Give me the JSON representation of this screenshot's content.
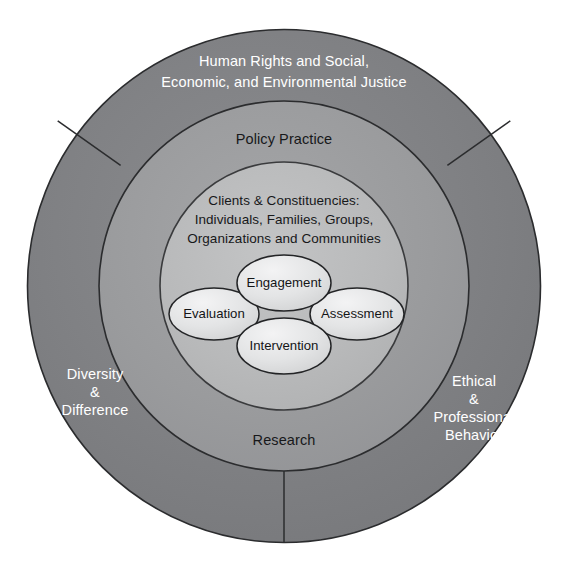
{
  "diagram": {
    "background_color": "#ffffff",
    "center": {
      "x": 284,
      "y": 286
    },
    "rings": {
      "outer": {
        "name": "outer-ring",
        "radius": 257,
        "fill": "#7f8083",
        "stroke": "#2b2c2e",
        "text_color": "#ffffff",
        "labels": {
          "top": [
            "Human Rights and Social,",
            "Economic, and Environmental Justice"
          ],
          "left": [
            "Diversity",
            "&",
            "Difference"
          ],
          "right": [
            "Ethical",
            "&",
            "Professional",
            "Behavior"
          ]
        }
      },
      "middle": {
        "name": "middle-ring",
        "radius": 185,
        "fill": "#9b9c9e",
        "stroke": "#2b2c2e",
        "text_color": "#17181a",
        "labels": {
          "top": "Policy Practice",
          "bottom": "Research"
        }
      },
      "inner": {
        "name": "inner-circle",
        "radius": 124,
        "fill": "#b9babb",
        "stroke": "#3a3b3d",
        "text_color": "#17181a",
        "labels": [
          "Clients & Constituencies:",
          "Individuals, Families, Groups,",
          "Organizations and Communities"
        ]
      }
    },
    "ellipses": [
      {
        "id": "engagement",
        "label": "Engagement",
        "cx": 284,
        "cy": 283,
        "rx": 47,
        "ry": 28,
        "fill": "#e4e5e6",
        "stroke": "#232426"
      },
      {
        "id": "evaluation",
        "label": "Evaluation",
        "cx": 214,
        "cy": 314,
        "rx": 45,
        "ry": 26,
        "fill": "#e4e5e6",
        "stroke": "#232426"
      },
      {
        "id": "assessment",
        "label": "Assessment",
        "cx": 357,
        "cy": 314,
        "rx": 47,
        "ry": 26,
        "fill": "#e4e5e6",
        "stroke": "#232426"
      },
      {
        "id": "intervention",
        "label": "Intervention",
        "cx": 284,
        "cy": 346,
        "rx": 47,
        "ry": 28,
        "fill": "#e4e5e6",
        "stroke": "#232426"
      }
    ],
    "dividers": [
      {
        "id": "divider-upper-left",
        "angle_deg": 208
      },
      {
        "id": "divider-upper-right",
        "angle_deg": 332
      },
      {
        "id": "divider-bottom",
        "angle_deg": 90
      }
    ]
  }
}
